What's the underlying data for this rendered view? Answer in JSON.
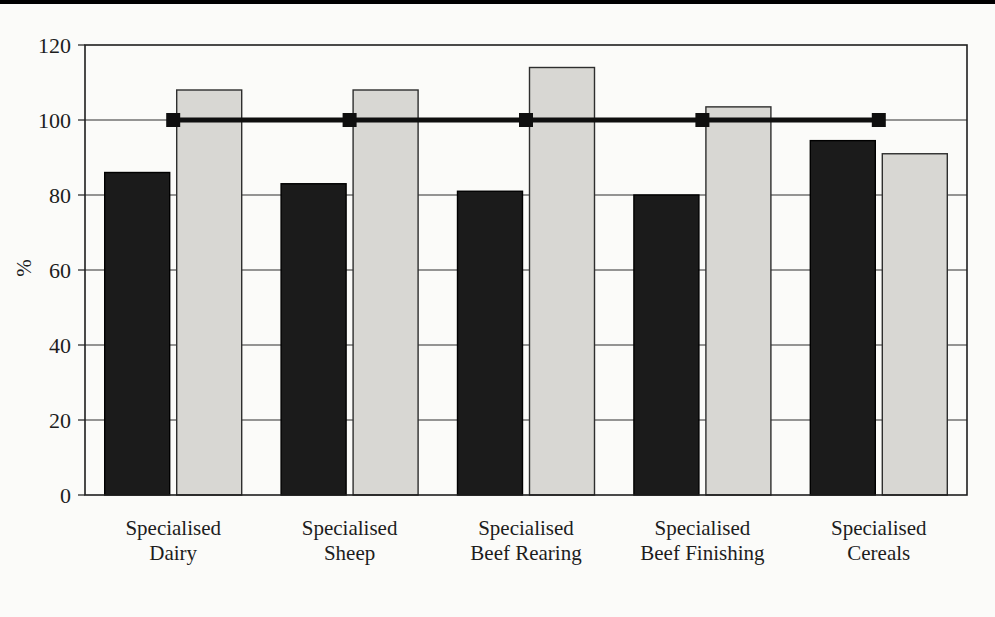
{
  "page": {
    "background": "#fbfbf9",
    "top_rule_color": "#000000"
  },
  "chart_data": {
    "type": "bar",
    "title": "",
    "ylabel": "%",
    "xlabel": "",
    "categories": [
      "Specialised\nDairy",
      "Specialised\nSheep",
      "Specialised\nBeef Rearing",
      "Specialised\nBeef Finishing",
      "Specialised\nCereals"
    ],
    "series": [
      {
        "key": "dark-bars",
        "color": "#1b1b1b",
        "border": "#000000",
        "values": [
          86,
          83,
          81,
          80,
          94.5
        ]
      },
      {
        "key": "light-bars",
        "color": "#d8d7d3",
        "border": "#2e2e2e",
        "values": [
          108,
          108,
          114,
          103.5,
          91
        ]
      }
    ],
    "reference_line": {
      "key": "reference-100",
      "value": 100,
      "marker": "square",
      "color": "#0f0f0f"
    },
    "yticks": [
      0,
      20,
      40,
      60,
      80,
      100,
      120
    ],
    "ylim": [
      0,
      120
    ],
    "grid": true,
    "legend": false,
    "grid_color": "#2f2f2f",
    "border_color": "#1f1f1f",
    "text_color": "#1d1d1d"
  }
}
